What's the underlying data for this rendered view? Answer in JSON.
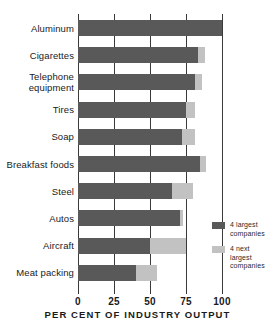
{
  "chart_data": {
    "type": "bar",
    "orientation": "horizontal",
    "stacked": true,
    "title": "",
    "xlabel": "PER CENT OF INDUSTRY OUTPUT",
    "ylabel": "",
    "xlim": [
      0,
      100
    ],
    "xticks": [
      0,
      25,
      50,
      75,
      100
    ],
    "xtick_labels": [
      "0",
      "25",
      "50",
      "75",
      "100"
    ],
    "grid": true,
    "grid_axis": "x",
    "legend_position": "right",
    "categories": [
      "Aluminum",
      "Cigarettes",
      "Telephone\nequipment",
      "Tires",
      "Soap",
      "Breakfast foods",
      "Steel",
      "Autos",
      "Aircraft",
      "Meat packing"
    ],
    "series": [
      {
        "name": "4 largest\ncompanies",
        "color": "#595959",
        "values": [
          100,
          83,
          81,
          75,
          72,
          85,
          65,
          71,
          50,
          40
        ]
      },
      {
        "name": "4 next\nlargest\ncompanies",
        "color": "#c2c2c2",
        "values": [
          0,
          5,
          5,
          6,
          9,
          4,
          15,
          2,
          25,
          15
        ]
      }
    ],
    "totals": [
      100,
      88,
      86,
      81,
      81,
      89,
      80,
      73,
      75,
      55
    ]
  },
  "legend": {
    "items": [
      {
        "label": "4 largest\ncompanies",
        "swatch": "#595959"
      },
      {
        "label": "4 next\nlargest\ncompanies",
        "swatch": "#c2c2c2"
      }
    ]
  },
  "axis": {
    "title": "PER CENT OF INDUSTRY OUTPUT"
  }
}
